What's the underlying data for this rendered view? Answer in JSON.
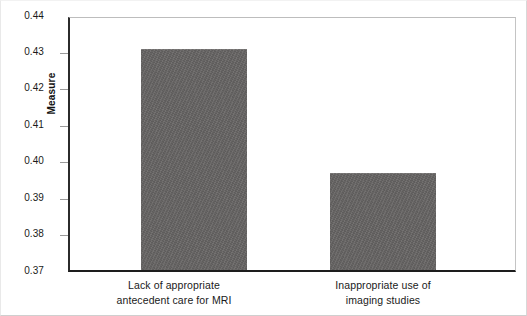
{
  "chart_data": {
    "type": "bar",
    "title": "",
    "subtitle": "",
    "xlabel": "",
    "ylabel": "Measure",
    "ylim": [
      0.37,
      0.44
    ],
    "ytick_step": 0.01,
    "yticks": [
      "0.44",
      "0.43",
      "0.42",
      "0.41",
      "0.40",
      "0.39",
      "0.38",
      "0.37"
    ],
    "ytick_values": [
      0.44,
      0.43,
      0.42,
      0.41,
      0.4,
      0.39,
      0.38,
      0.37
    ],
    "grid": false,
    "legend": "none",
    "categories": [
      "Lack of appropriate antecedent care for MRI",
      "Inappropriate use of imaging studies"
    ],
    "category_lines": [
      [
        "Lack of appropriate",
        "antecedent care for MRI"
      ],
      [
        "Inappropriate use of",
        "imaging studies"
      ]
    ],
    "values": [
      0.4313,
      0.397
    ],
    "value_labels": [
      "0.431",
      "0.397"
    ],
    "bar_color": "#666463",
    "axis_color": "#1d1d1d",
    "frame_color": "#bdbdbd"
  }
}
